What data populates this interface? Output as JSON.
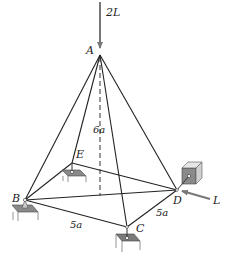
{
  "diagram": {
    "joints": {
      "A": "A",
      "B": "B",
      "C": "C",
      "D": "D",
      "E": "E"
    },
    "loads": {
      "vertical": "2L",
      "horizontal": "L"
    },
    "dimensions": {
      "height": "6a",
      "side_BC": "5a",
      "side_CD": "5a"
    },
    "colors": {
      "line": "#222222",
      "support_top": "#8a8a8a",
      "support_side": "#d0d0d0",
      "arrow": "#777777"
    }
  }
}
